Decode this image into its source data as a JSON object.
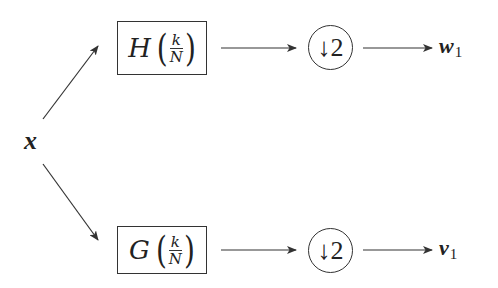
{
  "diagram": {
    "type": "two-channel filter bank (analysis stage)",
    "input": {
      "label": "x"
    },
    "branches": [
      {
        "name": "upper",
        "filter": {
          "function": "H",
          "numerator": "k",
          "denominator": "N"
        },
        "downsampler": {
          "arrow": "↓",
          "factor": "2"
        },
        "output": {
          "symbol": "w",
          "subscript": "1"
        }
      },
      {
        "name": "lower",
        "filter": {
          "function": "G",
          "numerator": "k",
          "denominator": "N"
        },
        "downsampler": {
          "arrow": "↓",
          "factor": "2"
        },
        "output": {
          "symbol": "v",
          "subscript": "1"
        }
      }
    ],
    "colors": {
      "stroke": "#333333",
      "text": "#222222",
      "background": "#ffffff"
    }
  }
}
